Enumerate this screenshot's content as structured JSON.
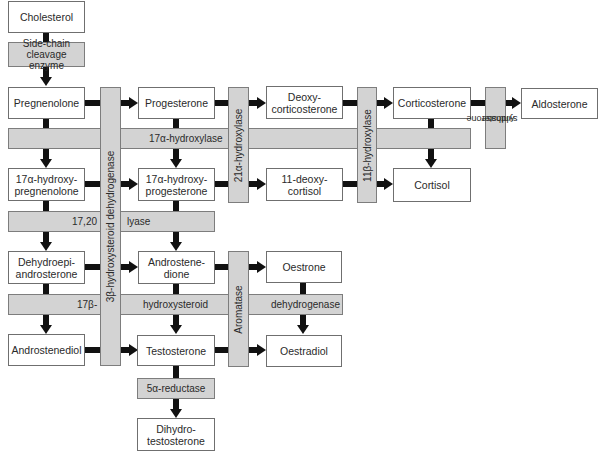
{
  "diagram": {
    "colors": {
      "node_fill": "#ffffff",
      "node_border": "#6f6f6f",
      "enzyme_fill": "#d3d3d3",
      "enzyme_border": "#7d7d7d",
      "arrow": "#111111"
    },
    "nodes": {
      "cholesterol": "Cholesterol",
      "pregnenolone": "Pregnenolone",
      "progesterone": "Progesterone",
      "deoxycorticosterone_l1": "Deoxy-",
      "deoxycorticosterone_l2": "corticosterone",
      "corticosterone": "Corticosterone",
      "aldosterone": "Aldosterone",
      "hydroxypregnenolone_l1": "17α-hydroxy-",
      "hydroxypregnenolone_l2": "pregnenolone",
      "hydroxyprogesterone_l1": "17α-hydroxy-",
      "hydroxyprogesterone_l2": "progesterone",
      "deoxycortisol_l1": "11-deoxy-",
      "deoxycortisol_l2": "cortisol",
      "cortisol": "Cortisol",
      "dhea_l1": "Dehydroepi-",
      "dhea_l2": "androsterone",
      "androstenedione_l1": "Androstene-",
      "androstenedione_l2": "dione",
      "oestrone": "Oestrone",
      "androstenediol": "Androstenediol",
      "testosterone": "Testosterone",
      "oestradiol": "Oestradiol",
      "dihydrotestosterone_l1": "Dihydro-",
      "dihydrotestosterone_l2": "testosterone"
    },
    "enzymes": {
      "side_chain_l1": "Side-chain",
      "side_chain_l2": "cleavage enzyme",
      "hydroxylase_17a": "17α-hydroxylase",
      "lyase_part1": "17,20",
      "lyase_part2": "lyase",
      "hsd17b_part1": "17β-",
      "hsd17b_part2": "hydroxysteroid",
      "hsd17b_part3": "dehydrogenase",
      "hsd3b": "3β-hydroxysteroid dehydrogenase",
      "hydroxylase_21a": "21α-hydroxylase",
      "hydroxylase_11b": "11β-hydroxylase",
      "aldosterone_synthase_l1": "Aldosterone",
      "aldosterone_synthase_l2": "synthase",
      "aromatase": "Aromatase",
      "reductase_5a": "5α-reductase"
    }
  }
}
